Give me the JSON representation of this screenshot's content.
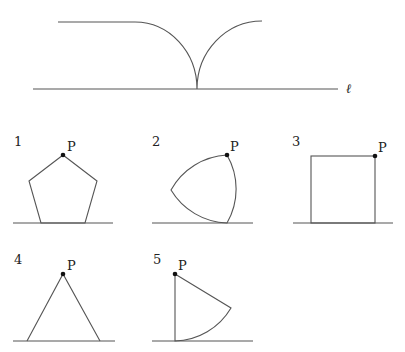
{
  "top_figure": {
    "line_label": "ℓ",
    "description": "Locus curve traced above line ℓ"
  },
  "figures": [
    {
      "number": "1",
      "shape": "regular-pentagon",
      "point_label": "P"
    },
    {
      "number": "2",
      "shape": "reuleaux-triangle",
      "point_label": "P"
    },
    {
      "number": "3",
      "shape": "square",
      "point_label": "P"
    },
    {
      "number": "4",
      "shape": "isosceles-triangle",
      "point_label": "P"
    },
    {
      "number": "5",
      "shape": "circular-sector",
      "point_label": "P"
    }
  ],
  "colors": {
    "line": "#555555",
    "point": "#111111",
    "text": "#222222"
  }
}
